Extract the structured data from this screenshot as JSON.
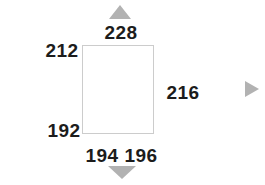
{
  "canvas": {
    "width": 265,
    "height": 185,
    "background": "#ffffff"
  },
  "rectangle": {
    "fill": "#ffffff",
    "border_color": "#cccccc"
  },
  "labels": {
    "top": "228",
    "upper_left": "212",
    "right": "216",
    "lower_left": "192",
    "bottom_left": "194",
    "bottom_right": "196"
  },
  "arrows": {
    "fill_color": "#b2b2b2",
    "up_icon": "triangle-up",
    "right_icon": "triangle-right",
    "down_icon": "triangle-down"
  },
  "text_color": "#1c1c1c"
}
